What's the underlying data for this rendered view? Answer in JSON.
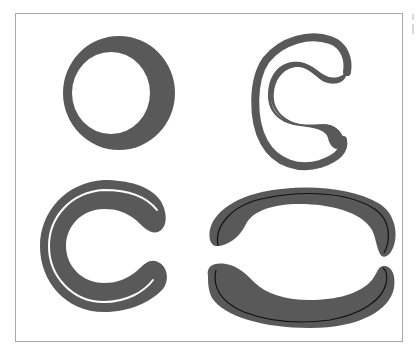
{
  "figure": {
    "type": "topology-shapes",
    "colors": {
      "shape_fill": "#595959",
      "frame_border": "#a9a9a9",
      "background": "#ffffff",
      "line": "#111111",
      "slit": "#ffffff"
    },
    "panels": [
      {
        "id": "top-left",
        "description": "annulus (ring) with off-center hole"
      },
      {
        "id": "top-right",
        "description": "thin outer loop enclosing a thick S-shaped inner blob joined at upper right"
      },
      {
        "id": "bottom-left",
        "description": "thick C-shape with thin white slit along outer band"
      },
      {
        "id": "bottom-right",
        "description": "two separated crescents (upper arch and lower bowl), each with a thin black centerline"
      }
    ]
  }
}
